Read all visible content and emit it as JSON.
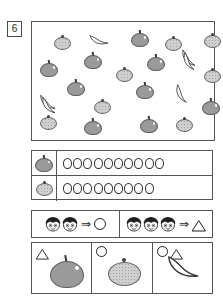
{
  "problem": {
    "number": "6"
  },
  "fruit_panel": {
    "name": "fruit-scatter-panel",
    "items": [
      {
        "type": "orange",
        "x": 22,
        "y": 13
      },
      {
        "type": "banana",
        "x": 57,
        "y": 9,
        "rot": -12,
        "variant": "single"
      },
      {
        "type": "apple",
        "x": 99,
        "y": 8
      },
      {
        "type": "orange",
        "x": 133,
        "y": 14
      },
      {
        "type": "orange",
        "x": 172,
        "y": 11
      },
      {
        "type": "apple",
        "x": 8,
        "y": 38
      },
      {
        "type": "apple",
        "x": 52,
        "y": 30
      },
      {
        "type": "apple",
        "x": 115,
        "y": 32
      },
      {
        "type": "banana",
        "x": 147,
        "y": 28,
        "rot": 18,
        "variant": "bunch"
      },
      {
        "type": "orange",
        "x": 84,
        "y": 45
      },
      {
        "type": "orange",
        "x": 172,
        "y": 46
      },
      {
        "type": "apple",
        "x": 35,
        "y": 57
      },
      {
        "type": "apple",
        "x": 104,
        "y": 60
      },
      {
        "type": "banana",
        "x": 6,
        "y": 72,
        "rot": 8,
        "variant": "bunch"
      },
      {
        "type": "banana",
        "x": 140,
        "y": 64,
        "rot": 30,
        "variant": "single"
      },
      {
        "type": "orange",
        "x": 62,
        "y": 77
      },
      {
        "type": "apple",
        "x": 170,
        "y": 76
      },
      {
        "type": "orange",
        "x": 8,
        "y": 93
      },
      {
        "type": "apple",
        "x": 52,
        "y": 96
      },
      {
        "type": "apple",
        "x": 108,
        "y": 94
      },
      {
        "type": "orange",
        "x": 144,
        "y": 95
      }
    ]
  },
  "tally": {
    "name": "tally-table",
    "rows": [
      {
        "key_icon": "apple-icon",
        "count": 10
      },
      {
        "key_icon": "orange-icon",
        "count": 9
      }
    ]
  },
  "legend": {
    "name": "legend-bar",
    "cells": [
      {
        "faces": 2,
        "arrow": "⇒",
        "shape": "circle"
      },
      {
        "faces": 3,
        "arrow": "⇒",
        "shape": "triangle"
      }
    ]
  },
  "answers": {
    "name": "answer-row",
    "cells": [
      {
        "shapes": [
          "triangle"
        ],
        "fruit": "apple"
      },
      {
        "shapes": [
          "circle"
        ],
        "fruit": "orange"
      },
      {
        "shapes": [
          "circle",
          "triangle"
        ],
        "fruit": "banana"
      }
    ]
  },
  "colors": {
    "apple_fill": "#9a9a9a",
    "orange_fill": "#cfcfcf",
    "banana_fill": "#ffffff",
    "outline": "#555555",
    "ink": "#1f1f1f"
  }
}
